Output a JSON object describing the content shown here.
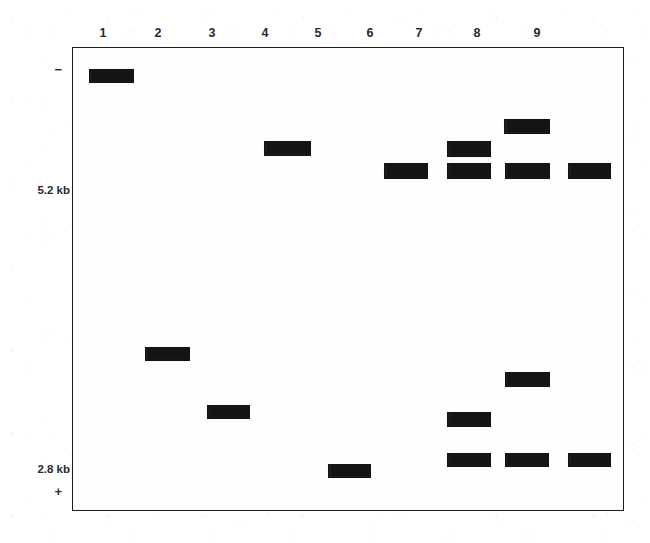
{
  "figure": {
    "type": "agarose-gel-electrophoresis-diagram",
    "width": 650,
    "height": 543,
    "background_color": "#ffffff",
    "band_color": "#141414",
    "border_color": "#1c1c1c"
  },
  "gel": {
    "box": {
      "left": 72,
      "top": 47,
      "width": 552,
      "height": 464
    },
    "lane_labels": [
      "1",
      "2",
      "3",
      "4",
      "5",
      "6",
      "7",
      "8",
      "9"
    ],
    "lane_x": [
      103,
      158,
      212,
      265,
      318,
      370,
      419,
      477,
      537
    ],
    "size_markers": [
      {
        "label": "5.2 kb",
        "y": 190
      },
      {
        "label": "2.8 kb",
        "y": 469
      }
    ],
    "polarity": [
      {
        "label": "−",
        "name": "negative-electrode-marker",
        "y": 70
      },
      {
        "label": "+",
        "name": "positive-electrode-marker",
        "y": 492
      }
    ]
  },
  "chart_data": {
    "type": "gel-electrophoresis",
    "title": "",
    "xlabel": "",
    "ylabel": "",
    "axis_note": "Migration from negative (top, −) to positive (bottom, +); larger fragments migrate less",
    "size_scale_kb": [
      5.2,
      2.8
    ],
    "size_scale_y_px": [
      190,
      469
    ],
    "lanes": [
      {
        "lane": 1,
        "x_center": 110,
        "bands": [
          {
            "y_center": 75,
            "width": 45,
            "height": 14,
            "approx_kb": 9.6
          }
        ]
      },
      {
        "lane": 2,
        "x_center": 166,
        "bands": [
          {
            "y_center": 353,
            "width": 45,
            "height": 14,
            "approx_kb": 3.8
          }
        ]
      },
      {
        "lane": 3,
        "x_center": 227,
        "bands": [
          {
            "y_center": 411,
            "width": 43,
            "height": 14,
            "approx_kb": 3.2
          }
        ]
      },
      {
        "lane": 4,
        "x_center": 286,
        "bands": [
          {
            "y_center": 147,
            "width": 47,
            "height": 15,
            "approx_kb": 6.3
          }
        ]
      },
      {
        "lane": 5,
        "x_center": 348,
        "bands": [
          {
            "y_center": 470,
            "width": 43,
            "height": 14,
            "approx_kb": 2.8
          }
        ]
      },
      {
        "lane": 6,
        "x_center": 405,
        "bands": [
          {
            "y_center": 170,
            "width": 44,
            "height": 16,
            "approx_kb": 5.9
          }
        ]
      },
      {
        "lane": 7,
        "x_center": 468,
        "bands": [
          {
            "y_center": 148,
            "width": 44,
            "height": 16,
            "approx_kb": 6.3
          },
          {
            "y_center": 170,
            "width": 44,
            "height": 16,
            "approx_kb": 5.9
          },
          {
            "y_center": 418,
            "width": 44,
            "height": 15,
            "approx_kb": 3.2
          },
          {
            "y_center": 459,
            "width": 44,
            "height": 14,
            "approx_kb": 2.8
          }
        ]
      },
      {
        "lane": 8,
        "x_center": 526,
        "bands": [
          {
            "y_center": 125,
            "width": 46,
            "height": 15,
            "approx_kb": 7.0
          },
          {
            "y_center": 170,
            "width": 45,
            "height": 16,
            "approx_kb": 5.9
          },
          {
            "y_center": 378,
            "width": 45,
            "height": 15,
            "approx_kb": 3.5
          },
          {
            "y_center": 459,
            "width": 44,
            "height": 14,
            "approx_kb": 2.8
          }
        ]
      },
      {
        "lane": 9,
        "x_center": 588,
        "bands": [
          {
            "y_center": 170,
            "width": 43,
            "height": 16,
            "approx_kb": 5.9
          },
          {
            "y_center": 459,
            "width": 43,
            "height": 14,
            "approx_kb": 2.8
          }
        ]
      }
    ]
  }
}
